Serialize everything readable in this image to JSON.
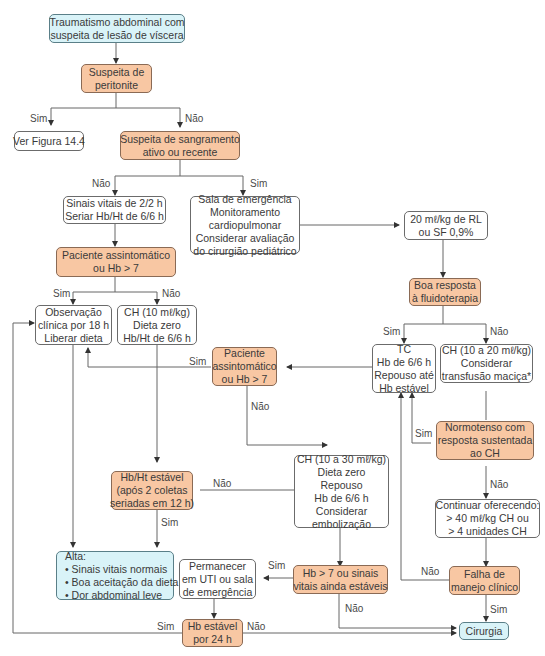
{
  "colors": {
    "decision_fill": "#f8c7a3",
    "terminal_fill": "#d9f3f8",
    "action_fill": "#ffffff",
    "line": "#555555"
  },
  "nodes": {
    "start": {
      "lines": [
        "Traumatismo abdominal com",
        "suspeita de lesão de víscera"
      ]
    },
    "peritonite": {
      "lines": [
        "Suspeita de",
        "peritonite"
      ]
    },
    "ver_figura": {
      "lines": [
        "Ver Figura 14.4"
      ]
    },
    "sangramento": {
      "lines": [
        "Suspeita de sangramento",
        "ativo ou recente"
      ]
    },
    "sinais_vitais": {
      "lines": [
        "Sinais vitais de 2/2 h",
        "Seriar Hb/Ht de 6/6 h"
      ]
    },
    "sala_emergencia": {
      "lines": [
        "Sala de emergência",
        "Monitoramento",
        "cardiopulmonar",
        "Considerar avaliação",
        "do cirurgião pediátrico"
      ]
    },
    "rl_sf": {
      "lines": [
        "20 mℓ/kg de RL",
        "ou SF 0,9%"
      ]
    },
    "assintomatico_1": {
      "lines": [
        "Paciente assintomático",
        "ou Hb > 7"
      ]
    },
    "boa_resposta": {
      "lines": [
        "Boa resposta",
        "à fluidoterapia"
      ]
    },
    "observacao": {
      "lines": [
        "Observação",
        "clínica por 18 h",
        "Liberar dieta"
      ]
    },
    "ch10": {
      "lines": [
        "CH (10 mℓ/kg)",
        "Dieta zero",
        "Hb/Ht de 6/6 h"
      ]
    },
    "assintomatico_2": {
      "lines": [
        "Paciente",
        "assintomático",
        "ou Hb > 7"
      ]
    },
    "tc": {
      "lines": [
        "TC",
        "Hb de 6/6 h",
        "Repouso até",
        "Hb estável"
      ]
    },
    "ch10_20": {
      "lines": [
        "CH (10 a 20 mℓ/kg)",
        "Considerar",
        "transfusão maciça*"
      ]
    },
    "normotenso": {
      "lines": [
        "Normotenso com",
        "resposta sustentada",
        "ao CH"
      ]
    },
    "hbht_estavel": {
      "lines": [
        "Hb/Ht estável",
        "(após 2 coletas",
        "seriadas em 12 h)"
      ]
    },
    "ch10_30": {
      "lines": [
        "CH (10 a 30 mℓ/kg)",
        "Dieta zero",
        "Repouso",
        "Hb de 6/6 h",
        "Considerar",
        "embolização"
      ]
    },
    "continuar": {
      "lines": [
        "Continuar oferecendo:",
        "> 40 mℓ/kg CH ou",
        "> 4 unidades CH"
      ]
    },
    "alta": {
      "lines": [
        "Alta:",
        "• Sinais vitais normais",
        "• Boa aceitação da dieta",
        "• Dor abdominal leve"
      ]
    },
    "permanecer": {
      "lines": [
        "Permanecer",
        "em UTI ou sala",
        "de emergência"
      ]
    },
    "hb7_sinais": {
      "lines": [
        "Hb > 7 ou sinais",
        "vitais ainda estáveis"
      ]
    },
    "falha": {
      "lines": [
        "Falha de",
        "manejo clínico"
      ]
    },
    "hb_estavel_24": {
      "lines": [
        "Hb estável",
        "por 24 h"
      ]
    },
    "cirurgia": {
      "lines": [
        "Cirurgia"
      ]
    }
  },
  "edge_labels": {
    "peritonite_sim": "Sim",
    "peritonite_nao": "Não",
    "sangramento_nao": "Não",
    "sangramento_sim": "Sim",
    "assint1_sim": "Sim",
    "assint1_nao": "Não",
    "boa_sim": "Sim",
    "boa_nao": "Não",
    "assint2_sim": "Sim",
    "assint2_nao": "Não",
    "normotenso_sim": "Sim",
    "normotenso_nao": "Não",
    "hbht_nao": "Não",
    "hbht_sim": "Sim",
    "hb7_sim": "Sim",
    "hb7_nao": "Não",
    "falha_nao": "Não",
    "falha_sim": "Sim",
    "hb24_sim": "Sim",
    "hb24_nao": "Não"
  }
}
